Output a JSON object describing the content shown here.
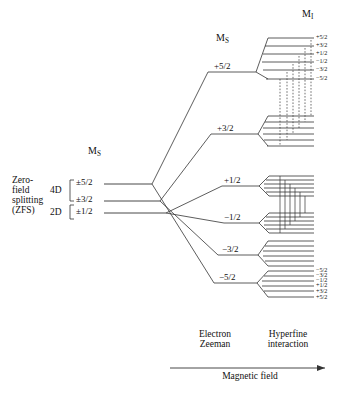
{
  "figure": {
    "type": "energy-level-diagram",
    "spin_system": {
      "electron_spin": "5/2",
      "nuclear_spin": "5/2"
    }
  },
  "left_panel": {
    "zfs_label_lines": [
      "Zero-",
      "field",
      "splitting",
      "(ZFS)"
    ],
    "zfs_label_text": "Zero-field splitting (ZFS)",
    "ms_header": "M",
    "ms_header_sub": "S",
    "brackets": [
      {
        "label": "4D",
        "spans": [
          "±5/2",
          "±3/2"
        ]
      },
      {
        "label": "2D",
        "spans": [
          "±3/2",
          "±1/2"
        ]
      }
    ],
    "levels": [
      {
        "label": "±5/2"
      },
      {
        "label": "±3/2"
      },
      {
        "label": "±1/2"
      }
    ]
  },
  "zeeman_panel": {
    "ms_header": "M",
    "ms_header_sub": "S",
    "levels": [
      {
        "label": "+5/2"
      },
      {
        "label": "+3/2"
      },
      {
        "label": "+1/2"
      },
      {
        "label": "−1/2"
      },
      {
        "label": "−3/2"
      },
      {
        "label": "−5/2"
      }
    ]
  },
  "hyperfine_panel": {
    "mi_header": "M",
    "mi_header_sub": "I",
    "top_group_labels": [
      "+5/2",
      "+3/2",
      "+1/2",
      "−1/2",
      "−3/2",
      "−5/2"
    ],
    "bottom_group_labels": [
      "−5/2",
      "−3/2",
      "−1/2",
      "+1/2",
      "+3/2",
      "+5/2"
    ],
    "lines_per_group": 6,
    "groups": 6
  },
  "axis": {
    "column_labels": [
      {
        "line1": "Electron",
        "line2": "Zeeman"
      },
      {
        "line1": "Hyperfine",
        "line2": "interaction"
      }
    ],
    "arrow_label": "Magnetic field"
  },
  "colors": {
    "ink": "#1a1a1a",
    "line": "#333333",
    "background": "#ffffff"
  }
}
